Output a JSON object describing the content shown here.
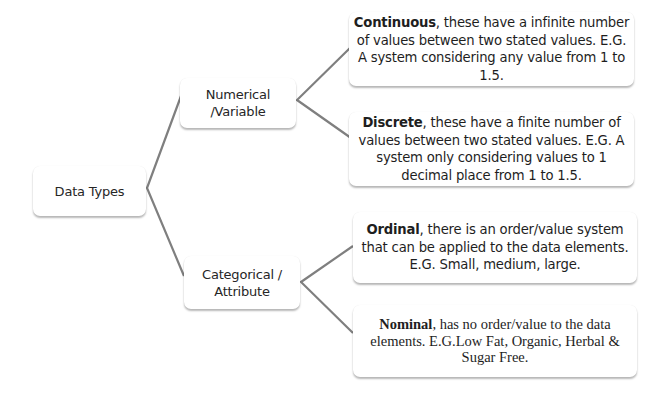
{
  "diagram": {
    "root": {
      "label": "Data Types"
    },
    "branches": [
      {
        "label": "Numerical /Variable",
        "label_lines": [
          "Numerical",
          "/Variable"
        ],
        "children": [
          {
            "term": "Continuous",
            "text": ", these have a infinite number of values between two stated values. E.G. A system considering any value from 1 to 1.5."
          },
          {
            "term": "Discrete",
            "text": ", these have a finite number of values between two stated values. E.G. A system only considering values to 1 decimal place from 1 to 1.5."
          }
        ]
      },
      {
        "label": "Categorical / Attribute",
        "label_lines": [
          "Categorical /",
          "Attribute"
        ],
        "children": [
          {
            "term": "Ordinal",
            "text": ", there is an order/value system that can be applied to the data elements. E.G. Small, medium, large."
          },
          {
            "term": "Nominal",
            "text": ", has no order/value to the data elements. E.G.Low Fat, Organic, Herbal & Sugar Free."
          }
        ]
      }
    ]
  },
  "colors": {
    "connector": "#7f7f7f",
    "box_background": "#ffffff",
    "text": "#262626"
  }
}
